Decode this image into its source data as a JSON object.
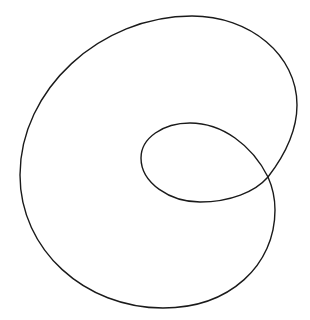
{
  "figure": {
    "background_color": "#ffffff",
    "stroke_color": "#1a1a1a",
    "shape": "limacon-with-inner-loop",
    "key_points": {
      "self_intersection": [
        268,
        177
      ],
      "outer_top": [
        192,
        16
      ],
      "outer_right": [
        297,
        105
      ],
      "outer_left": [
        20,
        175
      ],
      "outer_bottom": [
        163,
        308
      ],
      "outer_lower_right": [
        275,
        210
      ],
      "inner_top": [
        190,
        123
      ],
      "inner_left": [
        141,
        160
      ],
      "inner_bottom": [
        200,
        202
      ]
    }
  }
}
